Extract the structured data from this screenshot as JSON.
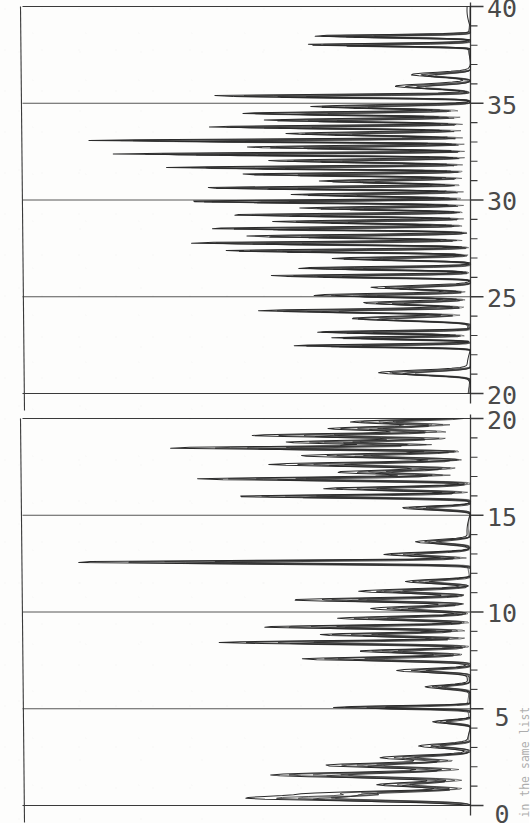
{
  "figure": {
    "caption": "in the same list",
    "line_color": "#2b2b2b",
    "axis_color": "#3a3a3a",
    "background": "#fdfdfc",
    "orientation_deg": -90,
    "panel_count": 2,
    "trace_count": 6
  },
  "chart_data": [
    {
      "type": "line",
      "title": "Top panel",
      "xlabel": "",
      "ylabel": "",
      "xlim": [
        0,
        20
      ],
      "ylim": [
        0,
        1
      ],
      "grid": false,
      "legend": "none",
      "major_ticks": [
        0,
        5,
        10,
        15,
        20
      ],
      "major_tick_labels": [
        "0",
        "5",
        "10",
        "15",
        "20"
      ],
      "minor_tick_interval": 1,
      "baseline_value": 0,
      "peaks": [
        {
          "x": 0.35,
          "height": 0.5,
          "width": 0.16
        },
        {
          "x": 0.62,
          "height": 0.3,
          "width": 0.13
        },
        {
          "x": 1.05,
          "height": 0.22,
          "width": 0.15
        },
        {
          "x": 1.55,
          "height": 0.46,
          "width": 0.17
        },
        {
          "x": 2.05,
          "height": 0.33,
          "width": 0.15
        },
        {
          "x": 2.45,
          "height": 0.2,
          "width": 0.14
        },
        {
          "x": 3.05,
          "height": 0.11,
          "width": 0.13
        },
        {
          "x": 4.3,
          "height": 0.09,
          "width": 0.12
        },
        {
          "x": 5.05,
          "height": 0.32,
          "width": 0.09
        },
        {
          "x": 6.1,
          "height": 0.1,
          "width": 0.12
        },
        {
          "x": 6.95,
          "height": 0.16,
          "width": 0.12
        },
        {
          "x": 7.55,
          "height": 0.38,
          "width": 0.12
        },
        {
          "x": 7.95,
          "height": 0.26,
          "width": 0.12
        },
        {
          "x": 8.4,
          "height": 0.58,
          "width": 0.11
        },
        {
          "x": 8.8,
          "height": 0.35,
          "width": 0.12
        },
        {
          "x": 9.2,
          "height": 0.48,
          "width": 0.11
        },
        {
          "x": 9.65,
          "height": 0.3,
          "width": 0.12
        },
        {
          "x": 10.15,
          "height": 0.22,
          "width": 0.14
        },
        {
          "x": 10.6,
          "height": 0.4,
          "width": 0.12
        },
        {
          "x": 11.05,
          "height": 0.25,
          "width": 0.13
        },
        {
          "x": 11.55,
          "height": 0.15,
          "width": 0.13
        },
        {
          "x": 12.55,
          "height": 0.92,
          "width": 0.1
        },
        {
          "x": 12.95,
          "height": 0.2,
          "width": 0.13
        },
        {
          "x": 13.6,
          "height": 0.12,
          "width": 0.13
        },
        {
          "x": 15.35,
          "height": 0.16,
          "width": 0.12
        },
        {
          "x": 15.95,
          "height": 0.55,
          "width": 0.1
        },
        {
          "x": 16.35,
          "height": 0.34,
          "width": 0.12
        },
        {
          "x": 16.85,
          "height": 0.62,
          "width": 0.11
        },
        {
          "x": 17.2,
          "height": 0.3,
          "width": 0.13
        },
        {
          "x": 17.6,
          "height": 0.45,
          "width": 0.13
        },
        {
          "x": 18.05,
          "height": 0.38,
          "width": 0.13
        },
        {
          "x": 18.45,
          "height": 0.68,
          "width": 0.1
        },
        {
          "x": 18.75,
          "height": 0.42,
          "width": 0.12
        },
        {
          "x": 19.1,
          "height": 0.5,
          "width": 0.12
        },
        {
          "x": 19.45,
          "height": 0.33,
          "width": 0.13
        },
        {
          "x": 19.8,
          "height": 0.28,
          "width": 0.13
        }
      ]
    },
    {
      "type": "line",
      "title": "Bottom panel",
      "xlabel": "",
      "ylabel": "",
      "xlim": [
        20,
        40
      ],
      "ylim": [
        0,
        1
      ],
      "grid": false,
      "legend": "none",
      "major_ticks": [
        20,
        25,
        30,
        35,
        40
      ],
      "major_tick_labels": [
        "20",
        "25",
        "30",
        "35",
        "40"
      ],
      "minor_tick_interval": 1,
      "baseline_value": 0,
      "peaks": [
        {
          "x": 21.05,
          "height": 0.22,
          "width": 0.16
        },
        {
          "x": 22.45,
          "height": 0.45,
          "width": 0.09
        },
        {
          "x": 22.85,
          "height": 0.35,
          "width": 0.09
        },
        {
          "x": 23.15,
          "height": 0.4,
          "width": 0.09
        },
        {
          "x": 23.85,
          "height": 0.3,
          "width": 0.15
        },
        {
          "x": 24.25,
          "height": 0.52,
          "width": 0.12
        },
        {
          "x": 24.65,
          "height": 0.26,
          "width": 0.13
        },
        {
          "x": 25.05,
          "height": 0.38,
          "width": 0.12
        },
        {
          "x": 25.45,
          "height": 0.24,
          "width": 0.13
        },
        {
          "x": 26.05,
          "height": 0.5,
          "width": 0.1
        },
        {
          "x": 26.45,
          "height": 0.44,
          "width": 0.1
        },
        {
          "x": 26.95,
          "height": 0.35,
          "width": 0.11
        },
        {
          "x": 27.35,
          "height": 0.62,
          "width": 0.1
        },
        {
          "x": 27.75,
          "height": 0.7,
          "width": 0.1
        },
        {
          "x": 28.1,
          "height": 0.55,
          "width": 0.11
        },
        {
          "x": 28.5,
          "height": 0.65,
          "width": 0.1
        },
        {
          "x": 28.85,
          "height": 0.48,
          "width": 0.11
        },
        {
          "x": 29.2,
          "height": 0.6,
          "width": 0.1
        },
        {
          "x": 29.55,
          "height": 0.42,
          "width": 0.11
        },
        {
          "x": 29.9,
          "height": 0.72,
          "width": 0.1
        },
        {
          "x": 30.25,
          "height": 0.45,
          "width": 0.11
        },
        {
          "x": 30.6,
          "height": 0.68,
          "width": 0.1
        },
        {
          "x": 30.95,
          "height": 0.38,
          "width": 0.12
        },
        {
          "x": 31.3,
          "height": 0.58,
          "width": 0.1
        },
        {
          "x": 31.65,
          "height": 0.75,
          "width": 0.1
        },
        {
          "x": 32.0,
          "height": 0.5,
          "width": 0.11
        },
        {
          "x": 32.35,
          "height": 0.88,
          "width": 0.09
        },
        {
          "x": 32.7,
          "height": 0.55,
          "width": 0.11
        },
        {
          "x": 33.05,
          "height": 0.95,
          "width": 0.09
        },
        {
          "x": 33.4,
          "height": 0.46,
          "width": 0.12
        },
        {
          "x": 33.75,
          "height": 0.66,
          "width": 0.1
        },
        {
          "x": 34.1,
          "height": 0.52,
          "width": 0.11
        },
        {
          "x": 34.45,
          "height": 0.58,
          "width": 0.11
        },
        {
          "x": 34.8,
          "height": 0.4,
          "width": 0.12
        },
        {
          "x": 35.35,
          "height": 0.64,
          "width": 0.1
        },
        {
          "x": 35.85,
          "height": 0.18,
          "width": 0.16
        },
        {
          "x": 36.45,
          "height": 0.14,
          "width": 0.15
        },
        {
          "x": 38.0,
          "height": 0.42,
          "width": 0.09
        },
        {
          "x": 38.45,
          "height": 0.4,
          "width": 0.09
        }
      ]
    }
  ],
  "axes": {
    "top": {
      "labels": [
        "0",
        "5",
        "10",
        "15",
        "20"
      ]
    },
    "bottom": {
      "labels": [
        "20",
        "25",
        "30",
        "35",
        "40"
      ]
    }
  }
}
